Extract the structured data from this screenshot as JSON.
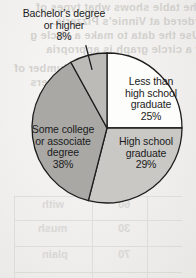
{
  "chart_data": {
    "type": "pie",
    "title": "",
    "categories": [
      "Less than high school graduate",
      "High school graduate",
      "Some college or associate degree",
      "Bachelor's degree or higher"
    ],
    "values": [
      25,
      29,
      38,
      8
    ],
    "unit": "%",
    "legend_position": "none",
    "labels_inside": true,
    "slices": [
      {
        "name": "less-than-high-school",
        "line1": "Less than",
        "line2": "high school",
        "line3": "graduate",
        "percent": "25%",
        "value": 25,
        "color": "#fdfdfc",
        "start_angle": 0,
        "end_angle": 90
      },
      {
        "name": "high-school-graduate",
        "line1": "High school",
        "line2": "graduate",
        "line3": "",
        "percent": "29%",
        "value": 29,
        "color": "#c9c8c5",
        "start_angle": 90,
        "end_angle": 194.4
      },
      {
        "name": "some-college-or-associate",
        "line1": "Some college",
        "line2": "or associate",
        "line3": "degree",
        "percent": "38%",
        "value": 38,
        "color": "#a9a8a5",
        "start_angle": 194.4,
        "end_angle": 331.2
      },
      {
        "name": "bachelors-or-higher",
        "line1": "Bachelor's degree",
        "line2": "or higher",
        "line3": "",
        "percent": "8%",
        "value": 8,
        "color": "#bcbbb8",
        "start_angle": 331.2,
        "end_angle": 360
      }
    ],
    "geometry": {
      "center_x": 107,
      "center_y": 128,
      "radius": 75
    },
    "stroke_color": "#1d1d1d"
  },
  "background": {
    "note": "scanned textbook page with mirrored show-through from reverse side",
    "bleed_text": [
      "The table shows what types of",
      "ordered at Vinnie's Pizzeria.",
      "Use the data to make a circle g",
      "why a circle graph is appropria",
      "Number of",
      "Customers"
    ],
    "ghost_table": {
      "cells": [
        {
          "text": "60",
          "x": 104,
          "y": 2
        },
        {
          "text": "30",
          "x": 104,
          "y": 26
        },
        {
          "text": "70",
          "x": 104,
          "y": 52
        },
        {
          "text": "with",
          "x": 28,
          "y": 2
        },
        {
          "text": "mush",
          "x": 24,
          "y": 26
        },
        {
          "text": "plain",
          "x": 28,
          "y": 52
        }
      ]
    }
  }
}
